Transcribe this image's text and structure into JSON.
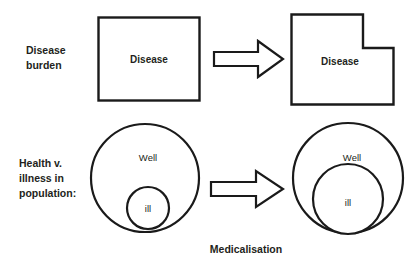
{
  "diagram": {
    "background_color": "#ffffff",
    "stroke_color": "#1a1a1a",
    "text_color": "#231f20",
    "caption": "Medicalisation",
    "rows": [
      {
        "row_id": "disease-burden",
        "row_label_lines": [
          "Disease",
          "burden"
        ],
        "before_shape_label": "Disease",
        "after_shape_label": "Disease",
        "transition_icon": "right-arrow-icon"
      },
      {
        "row_id": "health-illness",
        "row_label_lines": [
          "Health v.",
          "illness in",
          "population:"
        ],
        "before_outer_label": "Well",
        "before_inner_label": "ill",
        "after_outer_label": "Well",
        "after_inner_label": "ill",
        "transition_icon": "right-arrow-icon"
      }
    ]
  }
}
